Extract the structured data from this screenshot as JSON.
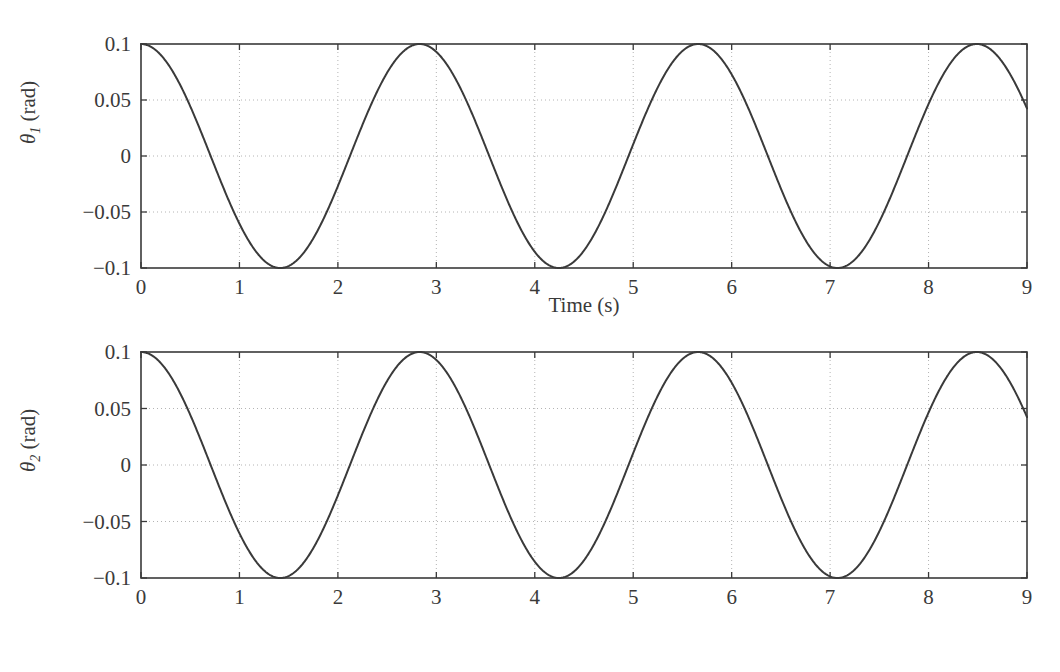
{
  "figure": {
    "background": "#ffffff",
    "width": 1060,
    "height": 672
  },
  "chart_data": [
    {
      "id": "theta1",
      "type": "line",
      "title": "",
      "xlabel": "Time (s)",
      "ylabel": "θ1 (rad)",
      "ylabel_symbol": "θ",
      "ylabel_subscript": "1",
      "ylabel_unit": "(rad)",
      "xlim": [
        0,
        9
      ],
      "ylim": [
        -0.1,
        0.1
      ],
      "xticks": [
        0,
        1,
        2,
        3,
        4,
        5,
        6,
        7,
        8,
        9
      ],
      "xticklabels": [
        "0",
        "1",
        "2",
        "3",
        "4",
        "5",
        "6",
        "7",
        "8",
        "9"
      ],
      "yticks": [
        -0.1,
        -0.05,
        0,
        0.05,
        0.1
      ],
      "yticklabels": [
        "−0.1",
        "−0.05",
        "0",
        "0.05",
        "0.1"
      ],
      "grid": true,
      "grid_style": "dotted",
      "grid_color": "#b4b4b4",
      "legend": "none",
      "line_color": "#3a3a3a",
      "line_width": 2.0,
      "series": [
        {
          "name": "θ1",
          "amplitude": 0.1,
          "period": 2.83,
          "phase_deg": 0,
          "form": "0.1*cos(2*pi*t/2.83)",
          "peaks_t": [
            0.0,
            2.83,
            5.66,
            8.49
          ],
          "peaks_y": [
            0.1,
            0.1,
            0.1,
            0.1
          ],
          "troughs_t": [
            1.415,
            4.245,
            7.075
          ],
          "troughs_y": [
            -0.1,
            -0.1,
            -0.1
          ],
          "zero_crossings_t": [
            0.7075,
            2.1225,
            3.5375,
            4.9525,
            6.3675,
            7.7825
          ],
          "samples_t": [
            0.0,
            0.25,
            0.5,
            0.75,
            1.0,
            1.25,
            1.5,
            1.75,
            2.0,
            2.25,
            2.5,
            2.75,
            3.0,
            3.25,
            3.5,
            3.75,
            4.0,
            4.25,
            4.5,
            4.75,
            5.0,
            5.25,
            5.5,
            5.75,
            6.0,
            6.25,
            6.5,
            6.75,
            7.0,
            7.25,
            7.5,
            7.75,
            8.0,
            8.25,
            8.5,
            8.75,
            9.0
          ],
          "samples_y": [
            0.1,
            0.0848,
            0.0438,
            -0.0097,
            -0.0588,
            -0.0915,
            -0.0996,
            -0.0812,
            -0.0406,
            0.0129,
            0.0616,
            0.0929,
            0.0992,
            0.0791,
            0.0373,
            -0.0162,
            -0.0643,
            -0.0941,
            -0.0988,
            -0.0769,
            -0.0341,
            0.0194,
            0.0669,
            0.0952,
            0.0983,
            0.0746,
            0.0308,
            -0.0226,
            -0.0694,
            -0.0962,
            -0.0976,
            -0.0722,
            -0.0275,
            0.0258,
            0.0718,
            0.0971,
            0.0969
          ]
        }
      ]
    },
    {
      "id": "theta2",
      "type": "line",
      "title": "",
      "xlabel": "Time (s)",
      "ylabel": "θ2 (rad)",
      "ylabel_symbol": "θ",
      "ylabel_subscript": "2",
      "ylabel_unit": "(rad)",
      "xlim": [
        0,
        9
      ],
      "ylim": [
        -0.1,
        0.1
      ],
      "xticks": [
        0,
        1,
        2,
        3,
        4,
        5,
        6,
        7,
        8,
        9
      ],
      "xticklabels": [
        "0",
        "1",
        "2",
        "3",
        "4",
        "5",
        "6",
        "7",
        "8",
        "9"
      ],
      "yticks": [
        -0.1,
        -0.05,
        0,
        0.05,
        0.1
      ],
      "yticklabels": [
        "−0.1",
        "−0.05",
        "0",
        "0.05",
        "0.1"
      ],
      "grid": true,
      "grid_style": "dotted",
      "grid_color": "#b4b4b4",
      "legend": "none",
      "line_color": "#3a3a3a",
      "line_width": 2.0,
      "series": [
        {
          "name": "θ2",
          "amplitude": 0.1,
          "period": 2.83,
          "phase_deg": 0,
          "form": "0.1*cos(2*pi*t/2.83)",
          "peaks_t": [
            0.0,
            2.83,
            5.66,
            8.49
          ],
          "peaks_y": [
            0.1,
            0.1,
            0.1,
            0.1
          ],
          "troughs_t": [
            1.415,
            4.245,
            7.075
          ],
          "troughs_y": [
            -0.1,
            -0.1,
            -0.1
          ],
          "zero_crossings_t": [
            0.7075,
            2.1225,
            3.5375,
            4.9525,
            6.3675,
            7.7825
          ],
          "samples_t": [
            0.0,
            0.25,
            0.5,
            0.75,
            1.0,
            1.25,
            1.5,
            1.75,
            2.0,
            2.25,
            2.5,
            2.75,
            3.0,
            3.25,
            3.5,
            3.75,
            4.0,
            4.25,
            4.5,
            4.75,
            5.0,
            5.25,
            5.5,
            5.75,
            6.0,
            6.25,
            6.5,
            6.75,
            7.0,
            7.25,
            7.5,
            7.75,
            8.0,
            8.25,
            8.5,
            8.75,
            9.0
          ],
          "samples_y": [
            0.1,
            0.0848,
            0.0438,
            -0.0097,
            -0.0588,
            -0.0915,
            -0.0996,
            -0.0812,
            -0.0406,
            0.0129,
            0.0616,
            0.0929,
            0.0992,
            0.0791,
            0.0373,
            -0.0162,
            -0.0643,
            -0.0941,
            -0.0988,
            -0.0769,
            -0.0341,
            0.0194,
            0.0669,
            0.0952,
            0.0983,
            0.0746,
            0.0308,
            -0.0226,
            -0.0694,
            -0.0962,
            -0.0976,
            -0.0722,
            -0.0275,
            0.0258,
            0.0718,
            0.0971,
            0.0969
          ]
        }
      ]
    }
  ],
  "colors": {
    "axis": "#3a3a3a",
    "curve": "#3a3a3a",
    "grid": "#b4b4b4",
    "text": "#3a3a3a",
    "background": "#ffffff"
  }
}
